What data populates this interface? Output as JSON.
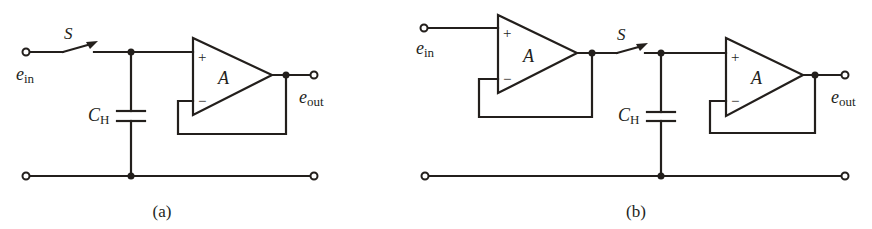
{
  "figure": {
    "diagrams": [
      {
        "id": "a",
        "caption": "(a)",
        "switch_label": "S",
        "input_label": "e",
        "input_sub": "in",
        "output_label": "e",
        "output_sub": "out",
        "capacitor_label": "C",
        "capacitor_sub": "H",
        "amp_label": "A",
        "plus": "+",
        "minus": "−"
      },
      {
        "id": "b",
        "caption": "(b)",
        "switch_label": "S",
        "input_label": "e",
        "input_sub": "in",
        "output_label": "e",
        "output_sub": "out",
        "capacitor_label": "C",
        "capacitor_sub": "H",
        "amp1_label": "A",
        "amp2_label": "A",
        "plus": "+",
        "minus": "−"
      }
    ]
  }
}
